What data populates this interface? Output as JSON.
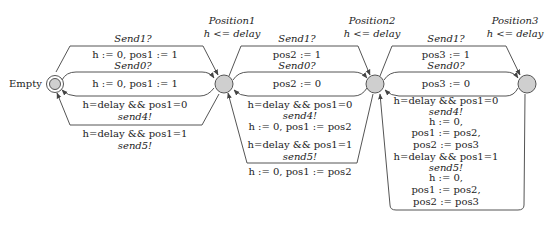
{
  "diagram": {
    "type": "timed-automaton",
    "states": [
      {
        "id": "empty",
        "name": "Empty",
        "invariant": "",
        "initial": true
      },
      {
        "id": "p1",
        "name": "Position1",
        "invariant": "h <= delay"
      },
      {
        "id": "p2",
        "name": "Position2",
        "invariant": "h <= delay"
      },
      {
        "id": "p3",
        "name": "Position3",
        "invariant": "h <= delay"
      }
    ],
    "labels": {
      "empty": "Empty",
      "p1_name": "Position1",
      "p1_inv": "h <= delay",
      "p2_name": "Position2",
      "p2_inv": "h <= delay",
      "p3_name": "Position3",
      "p3_inv": "h <= delay"
    },
    "edges": {
      "e_p1_send1_sync": "Send1?",
      "e_p1_send1_upd": "h := 0, pos1 := 1",
      "e_p1_send0_sync": "Send0?",
      "e_p1_send0_upd": "h := 0, pos1 := 1",
      "e_p1_back4_guard": "h=delay && pos1=0",
      "e_p1_back4_sync": "send4!",
      "e_p1_back5_guard": "h=delay && pos1=1",
      "e_p1_back5_sync": "send5!",
      "e_p2_send1_sync": "Send1?",
      "e_p2_send1_upd": "pos2 := 1",
      "e_p2_send0_sync": "Send0?",
      "e_p2_send0_upd": "pos2 := 0",
      "e_p2_back4_guard": "h=delay && pos1=0",
      "e_p2_back4_sync": "send4!",
      "e_p2_back4_upd": "h := 0, pos1 := pos2",
      "e_p2_back5_guard": "h=delay && pos1=1",
      "e_p2_back5_sync": "send5!",
      "e_p2_back5_upd": "h := 0, pos1 := pos2",
      "e_p3_send1_sync": "Send1?",
      "e_p3_send1_upd": "pos3 := 1",
      "e_p3_send0_sync": "Send0?",
      "e_p3_send0_upd": "pos3 := 0",
      "e_p3_back4_guard": "h=delay && pos1=0",
      "e_p3_back4_sync": "send4!",
      "e_p3_back4_upd1": "h := 0,",
      "e_p3_back4_upd2": "pos1 := pos2,",
      "e_p3_back4_upd3": "pos2 := pos3",
      "e_p3_back5_guard": "h=delay && pos1=1",
      "e_p3_back5_sync": "send5!",
      "e_p3_back5_upd1": "h := 0,",
      "e_p3_back5_upd2": "pos1 := pos2,",
      "e_p3_back5_upd3": "pos2 := pos3"
    },
    "colors": {
      "node_fill": "#cfcfcf",
      "stroke": "#555555",
      "text": "#222222"
    }
  }
}
